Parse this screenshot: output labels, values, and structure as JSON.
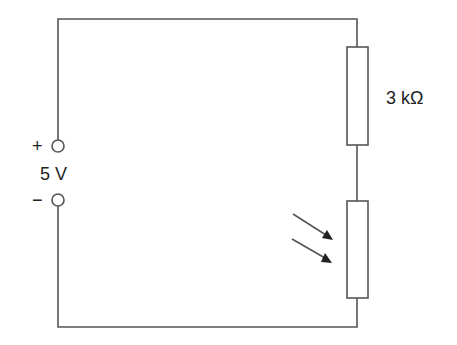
{
  "diagram": {
    "type": "circuit",
    "source": {
      "positive_label": "+",
      "negative_label": "−",
      "voltage_label": "5 V"
    },
    "resistor": {
      "value_label": "3 kΩ"
    },
    "ldr": {
      "name": "light-dependent resistor",
      "light_arrows": 2
    },
    "colors": {
      "wire": "#555555",
      "text": "#222222"
    }
  }
}
